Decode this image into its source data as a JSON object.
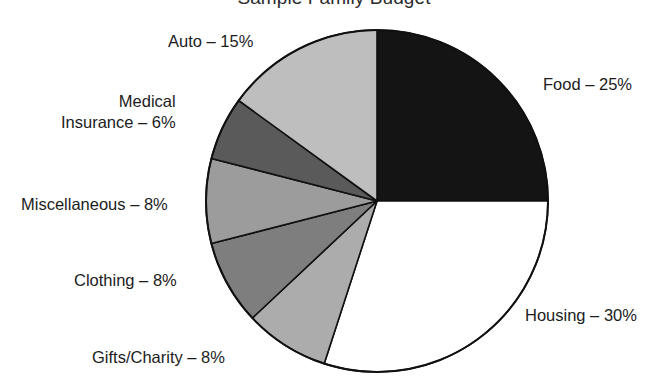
{
  "chart_data": {
    "type": "pie",
    "title": "Sample Family Budget",
    "xlabel": "",
    "ylabel": "",
    "legend_position": "none",
    "grid": false,
    "start_angle_deg": 0,
    "direction": "clockwise",
    "categories": [
      "Food",
      "Housing",
      "Gifts/Charity",
      "Clothing",
      "Miscellaneous",
      "Medical Insurance",
      "Auto"
    ],
    "values": [
      25,
      30,
      8,
      8,
      8,
      6,
      15
    ],
    "unit": "%",
    "total": 100,
    "slices": [
      {
        "name": "Food",
        "label_text": "Food – 25%",
        "label_lines": [
          "Food – 25%"
        ],
        "value": 25,
        "color": "#141414",
        "start_deg": 0,
        "end_deg": 90
      },
      {
        "name": "Housing",
        "label_text": "Housing – 30%",
        "label_lines": [
          "Housing – 30%"
        ],
        "value": 30,
        "color": "#ffffff",
        "start_deg": 90,
        "end_deg": 198
      },
      {
        "name": "Gifts/Charity",
        "label_text": "Gifts/Charity – 8%",
        "label_lines": [
          "Gifts/Charity – 8%"
        ],
        "value": 8,
        "color": "#acacac",
        "start_deg": 198,
        "end_deg": 226.8
      },
      {
        "name": "Clothing",
        "label_text": "Clothing – 8%",
        "label_lines": [
          "Clothing – 8%"
        ],
        "value": 8,
        "color": "#7e7e7e",
        "start_deg": 226.8,
        "end_deg": 255.6
      },
      {
        "name": "Miscellaneous",
        "label_text": "Miscellaneous – 8%",
        "label_lines": [
          "Miscellaneous – 8%"
        ],
        "value": 8,
        "color": "#9c9c9c",
        "start_deg": 255.6,
        "end_deg": 284.4
      },
      {
        "name": "Medical Insurance",
        "label_text": "Medical Insurance – 6%",
        "label_lines": [
          "Medical",
          "Insurance – 6%"
        ],
        "value": 6,
        "color": "#5a5a5a",
        "start_deg": 284.4,
        "end_deg": 306
      },
      {
        "name": "Auto",
        "label_text": "Auto – 15%",
        "label_lines": [
          "Auto – 15%"
        ],
        "value": 15,
        "color": "#bebebe",
        "start_deg": 306,
        "end_deg": 360
      }
    ],
    "colors": {
      "outline": "#111111",
      "background": "#ffffff",
      "text": "#1c1c1c"
    }
  }
}
